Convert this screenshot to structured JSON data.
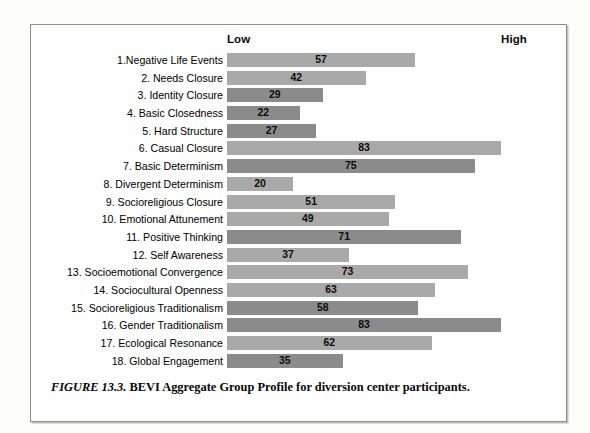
{
  "figure": {
    "caption_number": "FIGURE 13.3.",
    "caption_text": "BEVI Aggregate Group Profile for diversion center participants."
  },
  "axis": {
    "low_label": "Low",
    "high_label": "High"
  },
  "colors": {
    "bar_light": "#a9a9a9",
    "bar_dark": "#8b8b8b",
    "frame_border": "#8e8e8e",
    "text": "#000000"
  },
  "chart_data": {
    "type": "bar",
    "orientation": "horizontal",
    "title": "BEVI Aggregate Group Profile for diversion center participants",
    "xlabel": "",
    "ylabel": "",
    "xlim": [
      0,
      100
    ],
    "grid": false,
    "legend": "none",
    "axis_endpoint_labels": [
      "Low",
      "High"
    ],
    "categories": [
      "1.Negative Life Events",
      "2. Needs Closure",
      "3. Identity Closure",
      "4. Basic Closedness",
      "5. Hard Structure",
      "6. Casual Closure",
      "7. Basic Determinism",
      "8. Divergent Determinism",
      "9. Socioreligious Closure",
      "10. Emotional Attunement",
      "11. Positive Thinking",
      "12. Self Awareness",
      "13. Socioemotional Convergence",
      "14. Sociocultural Openness",
      "15. Socioreligious Traditionalism",
      "16. Gender Traditionalism",
      "17. Ecological Resonance",
      "18. Global Engagement"
    ],
    "values": [
      57,
      42,
      29,
      22,
      27,
      83,
      75,
      20,
      51,
      49,
      71,
      37,
      73,
      63,
      58,
      83,
      62,
      35
    ],
    "bar_shades": [
      "light",
      "light",
      "dark",
      "dark",
      "dark",
      "light",
      "dark",
      "light",
      "light",
      "light",
      "dark",
      "light",
      "light",
      "light",
      "dark",
      "dark",
      "light",
      "dark"
    ]
  }
}
